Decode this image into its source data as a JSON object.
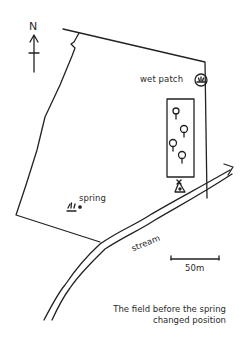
{
  "map": {
    "north_label": "N",
    "labels": {
      "wet_patch": "wet patch",
      "spring": "spring",
      "stream": "stream"
    },
    "scale": {
      "label": "50m"
    },
    "caption": {
      "line1": "The field before the spring",
      "line2": "changed position"
    },
    "features": [
      "north-arrow",
      "field-boundary",
      "wet-patch-symbol",
      "woodland-block",
      "trees",
      "tent",
      "spring-marsh-symbol",
      "stream",
      "scale-bar"
    ],
    "colors": {
      "ink": "#222222",
      "background": "#ffffff"
    }
  }
}
